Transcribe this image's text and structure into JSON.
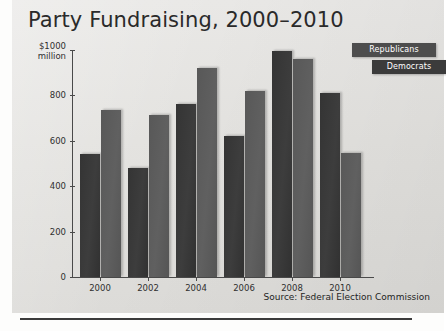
{
  "figure": {
    "title": "Party Fundraising, 2000–2010",
    "source": "Source: Federal Election Commission",
    "y_axis_top_label_line1": "$1000",
    "y_axis_top_label_line2": "million"
  },
  "legend": {
    "republicans": "Republicans",
    "democrats": "Democrats"
  },
  "colors": {
    "republican_bar": "#343434",
    "democrat_bar": "#585858",
    "panel_background": "#e5e4e1",
    "axis": "#4a4a4a",
    "title_text": "#2a2a2a"
  },
  "chart_data": {
    "type": "bar",
    "title": "Party Fundraising, 2000–2010",
    "subtitle": "",
    "xlabel": "",
    "ylabel": "$1000 million",
    "categories": [
      "2000",
      "2002",
      "2004",
      "2006",
      "2008",
      "2010"
    ],
    "series": [
      {
        "name": "Republicans",
        "values": [
          540,
          480,
          760,
          623,
          995,
          810
        ]
      },
      {
        "name": "Democrats",
        "values": [
          735,
          712,
          920,
          818,
          960,
          545
        ]
      }
    ],
    "ylim": [
      0,
      1000
    ],
    "yticks": [
      0,
      200,
      400,
      600,
      800,
      1000
    ],
    "ytick_labels": [
      "0",
      "200",
      "400",
      "600",
      "800",
      "$1000 million"
    ],
    "grid": false,
    "legend_position": "top-right",
    "annotations": [
      "Source: Federal Election Commission"
    ]
  }
}
